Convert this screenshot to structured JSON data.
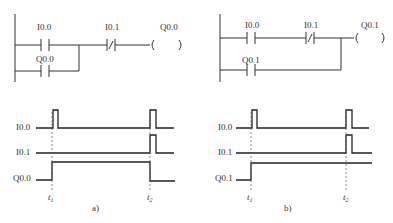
{
  "ladder_a": {
    "contact1": "I0.0",
    "contact2": "I0.1",
    "coil": "Q0.0",
    "holding_contact": "Q0.0"
  },
  "ladder_b": {
    "contact1": "I0.0",
    "contact2": "I0.1",
    "coil": "Q0.1",
    "holding_contact": "Q0.1"
  },
  "timing_a": {
    "signals": [
      "I0.0",
      "I0.1",
      "Q0.0"
    ],
    "t1": "t",
    "t1_sub": "1",
    "t2": "t",
    "t2_sub": "2",
    "caption": "a)"
  },
  "timing_b": {
    "signals": [
      "I0.0",
      "I0.1",
      "Q0.1"
    ],
    "t1": "t",
    "t1_sub": "1",
    "t2": "t",
    "t2_sub": "2",
    "caption": "b)"
  }
}
